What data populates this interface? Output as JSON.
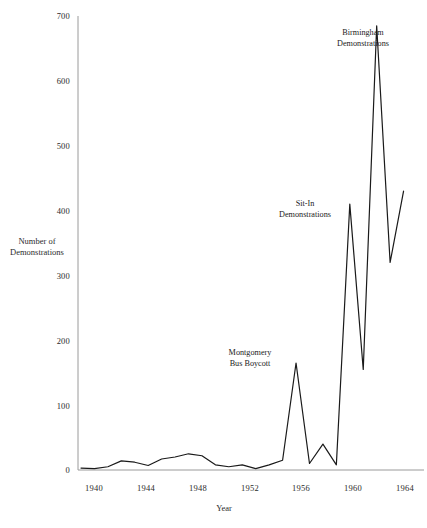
{
  "chart_data": {
    "type": "line",
    "title": "",
    "xlabel": "Year",
    "ylabel": "Number of Demonstrations",
    "ylabel_lines": [
      "Number of",
      "Demonstrations"
    ],
    "xlim": [
      1940,
      1965
    ],
    "ylim": [
      0,
      700
    ],
    "ytick_labels": [
      "0",
      "100",
      "200",
      "300",
      "400",
      "500",
      "600",
      "700"
    ],
    "ytick_values": [
      0,
      100,
      200,
      300,
      400,
      500,
      600,
      700
    ],
    "xtick_labels": [
      "1940",
      "1944",
      "1948",
      "1952",
      "1956",
      "1960",
      "1964"
    ],
    "xtick_values": [
      1940,
      1944,
      1948,
      1952,
      1956,
      1960,
      1964
    ],
    "grid": false,
    "legend": "none",
    "line_color": "#1a1a1a",
    "axis_color": "#9a9a9a",
    "x": [
      1940,
      1941,
      1942,
      1943,
      1944,
      1945,
      1946,
      1947,
      1948,
      1949,
      1950,
      1951,
      1952,
      1953,
      1954,
      1955,
      1956,
      1957,
      1958,
      1959,
      1960,
      1961,
      1962,
      1963,
      1964
    ],
    "values": [
      3,
      2,
      5,
      14,
      12,
      7,
      17,
      20,
      25,
      22,
      8,
      5,
      8,
      2,
      8,
      15,
      165,
      10,
      40,
      8,
      410,
      155,
      685,
      320,
      430
    ],
    "series": [
      {
        "name": "Number of Demonstrations",
        "values": [
          3,
          2,
          5,
          14,
          12,
          7,
          17,
          20,
          25,
          22,
          8,
          5,
          8,
          2,
          8,
          15,
          165,
          10,
          40,
          8,
          410,
          155,
          685,
          320,
          430
        ]
      }
    ],
    "annotations": [
      {
        "id": "montgomery",
        "lines": [
          "Montgomery",
          "Bus Boycott"
        ],
        "text": "Montgomery Bus Boycott",
        "x": 1956,
        "y": 165
      },
      {
        "id": "sit-in",
        "lines": [
          "Sit-In",
          "Demonstrations"
        ],
        "text": "Sit-In Demonstrations",
        "x": 1960,
        "y": 410
      },
      {
        "id": "birmingham",
        "lines": [
          "Birmingham",
          "Demonstrations"
        ],
        "text": "Birmingham Demonstrations",
        "x": 1962,
        "y": 685
      }
    ]
  },
  "axes": {
    "y_title_line1": "Number of",
    "y_title_line2": "Demonstrations",
    "x_title": "Year",
    "yticks": [
      "700",
      "600",
      "500",
      "400",
      "300",
      "200",
      "100",
      "0"
    ],
    "xticks": [
      "1940",
      "1944",
      "1948",
      "1952",
      "1956",
      "1960",
      "1964"
    ]
  },
  "annotations": {
    "birmingham_line1": "Birmingham",
    "birmingham_line2": "Demonstrations",
    "sitin_line1": "Sit-In",
    "sitin_line2": "Demonstrations",
    "montgomery_line1": "Montgomery",
    "montgomery_line2": "Bus Boycott"
  }
}
